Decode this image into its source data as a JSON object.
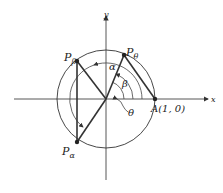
{
  "diagram": {
    "axes": {
      "x_label": "x",
      "y_label": "y"
    },
    "points": {
      "A": {
        "label": "A(1, 0)"
      },
      "P_theta": {
        "label": "P",
        "sub": "θ"
      },
      "P_beta": {
        "label": "P",
        "sub": "β"
      },
      "P_alpha": {
        "label": "P",
        "sub": "α"
      }
    },
    "angles": {
      "alpha": "α",
      "beta": "β",
      "theta": "θ"
    }
  }
}
